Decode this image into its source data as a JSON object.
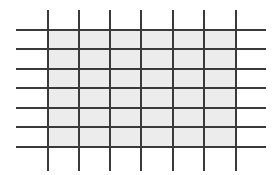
{
  "diagram": {
    "type": "grid",
    "colors": {
      "background": "#ffffff",
      "line": "#3a3a3a",
      "shade": "#ececec"
    },
    "vertical_lines": {
      "count": 7,
      "x": [
        48,
        79,
        110,
        141,
        173,
        204,
        236
      ],
      "y_start": 10,
      "y_end": 171
    },
    "horizontal_lines": {
      "count": 7,
      "y": [
        30,
        49,
        69,
        88,
        108,
        127,
        147
      ],
      "x_start": 16,
      "x_end": 266
    },
    "shaded_region": {
      "x": 48,
      "y": 30,
      "width": 188,
      "height": 117
    },
    "line_width": 2
  }
}
